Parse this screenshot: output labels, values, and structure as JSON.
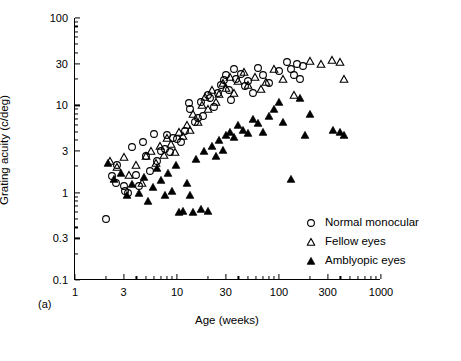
{
  "chart_data": {
    "type": "scatter",
    "title": "",
    "panel_label": "(a)",
    "xlabel": "Age (weeks)",
    "ylabel": "Grating acuity (c/deg)",
    "xscale": "log",
    "yscale": "log",
    "xlim": [
      1,
      1000
    ],
    "ylim": [
      0.1,
      100
    ],
    "xticks": [
      1,
      3,
      10,
      30,
      100,
      300,
      1000
    ],
    "xticklabels": [
      "1",
      "3",
      "10",
      "30",
      "100",
      "300",
      "1000"
    ],
    "yticks": [
      0.1,
      0.3,
      1,
      3,
      10,
      30,
      100
    ],
    "yticklabels": [
      "0.1",
      "0.3",
      "1",
      "3",
      "10",
      "30",
      "100"
    ],
    "grid": false,
    "legend_position": "lower-right-inside",
    "series": [
      {
        "name": "Normal monocular",
        "marker": "open-circle",
        "color": "#000000",
        "points": [
          [
            2.0,
            0.5
          ],
          [
            2.3,
            1.55
          ],
          [
            2.5,
            1.3
          ],
          [
            2.6,
            2.05
          ],
          [
            3.0,
            1.2
          ],
          [
            3.1,
            1.05
          ],
          [
            3.3,
            1.0
          ],
          [
            3.6,
            3.3
          ],
          [
            4.0,
            1.6
          ],
          [
            4.2,
            1.2
          ],
          [
            4.6,
            3.8
          ],
          [
            5.0,
            2.6
          ],
          [
            5.4,
            1.75
          ],
          [
            6.0,
            4.7
          ],
          [
            6.4,
            2.3
          ],
          [
            7.0,
            3.0
          ],
          [
            7.6,
            3.2
          ],
          [
            8.0,
            4.6
          ],
          [
            8.6,
            2.9
          ],
          [
            9.2,
            4.2
          ],
          [
            10.0,
            4.1
          ],
          [
            11.0,
            3.8
          ],
          [
            12.0,
            5.1
          ],
          [
            13.0,
            10.5
          ],
          [
            13.5,
            9.0
          ],
          [
            15.0,
            6.4
          ],
          [
            16.0,
            7.2
          ],
          [
            17.0,
            11.0
          ],
          [
            18.0,
            7.6
          ],
          [
            20.0,
            13.0
          ],
          [
            21.0,
            12.0
          ],
          [
            23.0,
            9.5
          ],
          [
            25.0,
            14.0
          ],
          [
            27.0,
            17.0
          ],
          [
            29.0,
            19.5
          ],
          [
            30.0,
            22.0
          ],
          [
            32.0,
            15.0
          ],
          [
            34.0,
            11.5
          ],
          [
            36.0,
            26.0
          ],
          [
            38.0,
            20.0
          ],
          [
            42.0,
            23.0
          ],
          [
            46.0,
            16.5
          ],
          [
            50.0,
            19.0
          ],
          [
            56.0,
            14.0
          ],
          [
            62.0,
            27.0
          ],
          [
            70.0,
            22.0
          ],
          [
            80.0,
            18.0
          ],
          [
            100.0,
            25.0
          ],
          [
            120.0,
            31.0
          ],
          [
            130.0,
            26.0
          ],
          [
            140.0,
            22.0
          ],
          [
            150.0,
            30.0
          ],
          [
            160.0,
            20.0
          ],
          [
            170.0,
            28.0
          ]
        ]
      },
      {
        "name": "Fellow eyes",
        "marker": "open-triangle",
        "color": "#000000",
        "points": [
          [
            2.2,
            2.3
          ],
          [
            2.6,
            1.95
          ],
          [
            3.0,
            2.55
          ],
          [
            3.4,
            1.6
          ],
          [
            4.0,
            2.1
          ],
          [
            4.5,
            1.3
          ],
          [
            5.0,
            2.6
          ],
          [
            5.6,
            3.0
          ],
          [
            6.2,
            2.2
          ],
          [
            6.8,
            3.4
          ],
          [
            7.4,
            2.7
          ],
          [
            8.0,
            4.2
          ],
          [
            8.8,
            3.6
          ],
          [
            9.5,
            2.9
          ],
          [
            10.5,
            5.0
          ],
          [
            11.5,
            4.4
          ],
          [
            12.5,
            6.0
          ],
          [
            13.5,
            5.2
          ],
          [
            14.5,
            8.0
          ],
          [
            16.0,
            6.5
          ],
          [
            17.5,
            10.0
          ],
          [
            19.0,
            12.5
          ],
          [
            20.0,
            9.0
          ],
          [
            22.0,
            15.0
          ],
          [
            24.0,
            11.0
          ],
          [
            26.0,
            13.5
          ],
          [
            28.0,
            18.0
          ],
          [
            30.0,
            16.0
          ],
          [
            33.0,
            21.0
          ],
          [
            36.0,
            14.0
          ],
          [
            40.0,
            19.0
          ],
          [
            45.0,
            24.0
          ],
          [
            50.0,
            17.0
          ],
          [
            58.0,
            21.0
          ],
          [
            66.0,
            15.5
          ],
          [
            75.0,
            18.5
          ],
          [
            90.0,
            26.0
          ],
          [
            110.0,
            20.0
          ],
          [
            140.0,
            13.0
          ],
          [
            200.0,
            32.0
          ],
          [
            260.0,
            30.0
          ],
          [
            330.0,
            33.0
          ],
          [
            400.0,
            31.0
          ],
          [
            430.0,
            20.0
          ]
        ]
      },
      {
        "name": "Amblyopic eyes",
        "marker": "filled-triangle",
        "color": "#000000",
        "points": [
          [
            2.1,
            2.2
          ],
          [
            2.4,
            1.45
          ],
          [
            2.8,
            1.7
          ],
          [
            3.2,
            0.95
          ],
          [
            3.6,
            1.25
          ],
          [
            4.2,
            1.0
          ],
          [
            4.8,
            1.5
          ],
          [
            5.2,
            0.8
          ],
          [
            5.8,
            1.15
          ],
          [
            6.4,
            1.9
          ],
          [
            7.0,
            1.4
          ],
          [
            7.6,
            0.95
          ],
          [
            8.2,
            1.7
          ],
          [
            9.0,
            1.05
          ],
          [
            9.8,
            2.1
          ],
          [
            10.5,
            0.6
          ],
          [
            11.5,
            0.62
          ],
          [
            12.5,
            1.3
          ],
          [
            13.5,
            0.95
          ],
          [
            14.5,
            0.6
          ],
          [
            15.5,
            2.4
          ],
          [
            17.0,
            0.65
          ],
          [
            18.5,
            3.0
          ],
          [
            20.0,
            0.62
          ],
          [
            22.0,
            3.4
          ],
          [
            24.0,
            2.6
          ],
          [
            26.0,
            4.0
          ],
          [
            28.0,
            3.1
          ],
          [
            30.0,
            4.6
          ],
          [
            33.0,
            5.0
          ],
          [
            36.0,
            4.3
          ],
          [
            40.0,
            6.0
          ],
          [
            44.0,
            5.2
          ],
          [
            50.0,
            4.8
          ],
          [
            56.0,
            7.0
          ],
          [
            62.0,
            6.2
          ],
          [
            70.0,
            5.0
          ],
          [
            80.0,
            7.5
          ],
          [
            90.0,
            9.0
          ],
          [
            100.0,
            11.0
          ],
          [
            110.0,
            6.5
          ],
          [
            130.0,
            1.45
          ],
          [
            160.0,
            12.0
          ],
          [
            180.0,
            4.6
          ],
          [
            200.0,
            8.0
          ],
          [
            340.0,
            5.2
          ],
          [
            400.0,
            4.9
          ],
          [
            430.0,
            4.6
          ]
        ]
      }
    ]
  },
  "legend": {
    "items": [
      {
        "label": "Normal monocular",
        "marker": "open-circle"
      },
      {
        "label": "Fellow eyes",
        "marker": "open-triangle"
      },
      {
        "label": "Amblyopic eyes",
        "marker": "filled-triangle"
      }
    ]
  }
}
